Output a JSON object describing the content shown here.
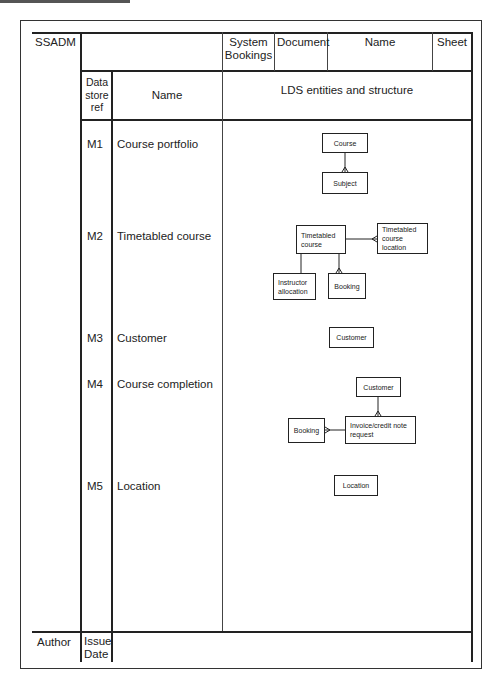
{
  "form": {
    "method": "SSADM",
    "system_label": "System",
    "system_value": "Bookings",
    "document_label": "Document",
    "name_label": "Name",
    "sheet_label": "Sheet",
    "col_ref_header": "Data store ref",
    "col_ref_header_lines": [
      "Data",
      "store",
      "ref"
    ],
    "col_name_header": "Name",
    "col_lds_header": "LDS entities and structure",
    "author_label": "Author",
    "issue_label": "Issue",
    "date_label": "Date"
  },
  "rows": [
    {
      "ref": "M1",
      "name": "Course portfolio"
    },
    {
      "ref": "M2",
      "name": "Timetabled course"
    },
    {
      "ref": "M3",
      "name": "Customer"
    },
    {
      "ref": "M4",
      "name": "Course completion"
    },
    {
      "ref": "M5",
      "name": "Location"
    }
  ],
  "entities": {
    "m1_course": "Course",
    "m1_subject": "Subject",
    "m2_timetabled_course": "Timetabled course",
    "m2_timetabled_course_location": "Timetabled course location",
    "m2_instructor_allocation": "Instructor allocation",
    "m2_booking": "Booking",
    "m3_customer": "Customer",
    "m4_customer": "Customer",
    "m4_booking": "Booking",
    "m4_invoice": "Invoice/credit note request",
    "m5_location": "Location"
  }
}
